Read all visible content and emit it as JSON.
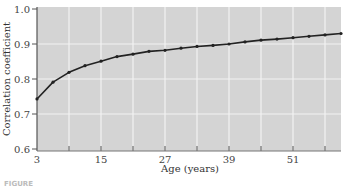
{
  "chart_data": {
    "type": "line",
    "title": "",
    "xlabel": "Age (years)",
    "ylabel": "Correlation coefficient",
    "x": [
      3,
      6,
      9,
      12,
      15,
      18,
      21,
      24,
      27,
      30,
      33,
      36,
      39,
      42,
      45,
      48,
      51,
      54,
      57,
      60
    ],
    "series": [
      {
        "name": "Correlation",
        "values": [
          0.743,
          0.791,
          0.819,
          0.838,
          0.851,
          0.864,
          0.871,
          0.879,
          0.882,
          0.888,
          0.893,
          0.896,
          0.9,
          0.906,
          0.911,
          0.914,
          0.918,
          0.922,
          0.926,
          0.93
        ]
      }
    ],
    "xlim": [
      3,
      60
    ],
    "ylim": [
      0.6,
      1.0
    ],
    "x_tick_labels": [
      "3",
      "15",
      "27",
      "39",
      "51"
    ],
    "x_minor_ticks": [
      9,
      21,
      33,
      45,
      57
    ],
    "y_tick_labels": [
      "0.6",
      "0.7",
      "0.8",
      "0.9",
      "1.0"
    ],
    "grid": true,
    "legend": "none",
    "colors": {
      "plot_bg": "#d4d4d4",
      "grid": "#f2f2f2",
      "line": "#222222"
    }
  },
  "caption_fragment": "FIGURE"
}
